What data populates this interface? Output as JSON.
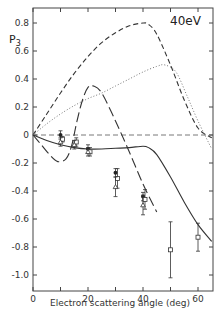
{
  "chart_data": {
    "type": "line",
    "title": "40eV",
    "xlabel": "Electron scattering angle (deg)",
    "ylabel": "P3",
    "xlim": [
      0,
      65
    ],
    "ylim": [
      -1.1,
      0.9
    ],
    "xticks": [
      0,
      20,
      40,
      60
    ],
    "xtick_labels": [
      "0",
      "20",
      "40",
      "60"
    ],
    "xminor_ticks": [
      10,
      30,
      50
    ],
    "yticks": [
      0.8,
      0.6,
      0.4,
      0.2,
      0,
      -0.2,
      -0.4,
      -0.6,
      -0.8,
      -1.0
    ],
    "ytick_labels": [
      "0.8",
      "0.6",
      "0.4",
      "0.2",
      "0",
      "-0.2",
      "-0.4",
      "-0.6",
      "-0.8",
      "-1.0"
    ],
    "grid": false,
    "reference_line": {
      "y": 0,
      "style": "dashed"
    },
    "series": [
      {
        "name": "theory-solid",
        "style": "solid",
        "x": [
          0,
          5,
          10,
          15,
          20,
          25,
          30,
          35,
          40,
          42,
          45,
          50,
          55,
          60,
          65
        ],
        "y": [
          0,
          -0.04,
          -0.07,
          -0.09,
          -0.1,
          -0.1,
          -0.095,
          -0.09,
          -0.08,
          -0.09,
          -0.14,
          -0.3,
          -0.48,
          -0.64,
          -0.76
        ]
      },
      {
        "name": "theory-short-dash",
        "style": "dashed",
        "x": [
          0,
          5,
          10,
          15,
          20,
          25,
          30,
          35,
          40,
          42,
          45,
          50,
          55,
          60,
          65
        ],
        "y": [
          0,
          0.15,
          0.3,
          0.44,
          0.56,
          0.66,
          0.73,
          0.78,
          0.8,
          0.79,
          0.72,
          0.5,
          0.25,
          0.05,
          -0.02
        ]
      },
      {
        "name": "theory-dotted",
        "style": "dotted",
        "x": [
          0,
          5,
          10,
          15,
          20,
          25,
          30,
          35,
          40,
          45,
          48,
          52,
          56,
          60,
          65
        ],
        "y": [
          0,
          0.08,
          0.15,
          0.21,
          0.26,
          0.3,
          0.35,
          0.4,
          0.45,
          0.49,
          0.5,
          0.45,
          0.28,
          0.1,
          -0.1
        ]
      },
      {
        "name": "theory-long-dash",
        "style": "long-dash",
        "x": [
          0,
          3,
          6,
          9,
          12,
          14,
          16,
          18,
          20,
          22,
          25,
          30,
          35,
          40,
          45
        ],
        "y": [
          0,
          -0.07,
          -0.14,
          -0.19,
          -0.17,
          -0.08,
          0.1,
          0.25,
          0.34,
          0.35,
          0.3,
          0.1,
          -0.12,
          -0.35,
          -0.55
        ]
      }
    ],
    "data_points": [
      {
        "marker": "filled-circle",
        "x": [
          10,
          20,
          30,
          40
        ],
        "y": [
          0.0,
          -0.1,
          -0.27,
          -0.44
        ],
        "yerr": [
          0.03,
          0.03,
          0.03,
          0.03
        ]
      },
      {
        "marker": "open-square",
        "x": [
          10,
          15,
          20,
          30,
          40,
          50,
          60
        ],
        "y": [
          -0.03,
          -0.05,
          -0.12,
          -0.31,
          -0.46,
          -0.82,
          -0.73
        ],
        "yerr": [
          0.02,
          0.03,
          0.03,
          0.07,
          0.07,
          0.2,
          0.1
        ]
      },
      {
        "marker": "open-triangle",
        "x": [
          10,
          15,
          20,
          30,
          40
        ],
        "y": [
          -0.05,
          -0.07,
          -0.12,
          -0.37,
          -0.5
        ],
        "yerr": [
          0.03,
          0.03,
          0.03,
          0.07,
          0.07
        ]
      }
    ]
  },
  "labels": {
    "energy": "40eV",
    "ylabel_main": "P",
    "ylabel_sub": "3",
    "xlabel": "Electron scattering angle (deg)"
  }
}
